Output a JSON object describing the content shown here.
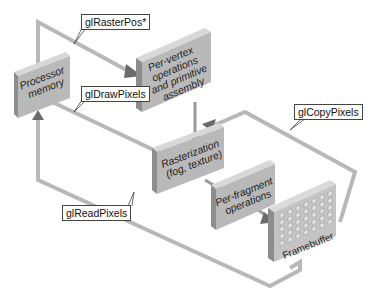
{
  "diagram": {
    "title": "",
    "nodes": [
      {
        "id": "processor-memory",
        "lines": [
          "Processor",
          "memory"
        ]
      },
      {
        "id": "per-vertex",
        "lines": [
          "Per-vertex",
          "operations",
          "and primitive",
          "assembly"
        ]
      },
      {
        "id": "rasterization",
        "lines": [
          "Rasterization",
          "(fog, texture)"
        ]
      },
      {
        "id": "per-fragment",
        "lines": [
          "Per-fragment",
          "operations"
        ]
      },
      {
        "id": "framebuffer",
        "lines": [
          "Framebuffer"
        ]
      }
    ],
    "edge_labels": {
      "raster_pos": "glRasterPos*",
      "draw_pixels": "glDrawPixels",
      "copy_pixels": "glCopyPixels",
      "read_pixels": "glReadPixels"
    },
    "edges": [
      {
        "from": "processor-memory",
        "to": "per-vertex",
        "label": "glRasterPos*"
      },
      {
        "from": "processor-memory",
        "to": "rasterization",
        "label": "glDrawPixels"
      },
      {
        "from": "per-vertex",
        "to": "rasterization",
        "label": ""
      },
      {
        "from": "rasterization",
        "to": "per-fragment",
        "label": ""
      },
      {
        "from": "per-fragment",
        "to": "framebuffer",
        "label": ""
      },
      {
        "from": "framebuffer",
        "to": "rasterization",
        "label": "glCopyPixels"
      },
      {
        "from": "framebuffer",
        "to": "processor-memory",
        "label": "glReadPixels"
      }
    ],
    "colors": {
      "box_face": "#b9b9b9",
      "box_side": "#8e8e8e",
      "box_top": "#d6d6d6",
      "path": "#b5b5b5",
      "arrow": "#6e6e6e"
    }
  }
}
